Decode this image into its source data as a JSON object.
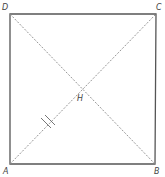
{
  "diagram": {
    "colors": {
      "side": "#555555",
      "diagonal": "#8a8a8a",
      "label": "#444444",
      "tick": "#666666"
    },
    "points": {
      "A": {
        "label": "A",
        "x": 10,
        "y": 164
      },
      "B": {
        "label": "B",
        "x": 155,
        "y": 164
      },
      "C": {
        "label": "C",
        "x": 156,
        "y": 14
      },
      "D": {
        "label": "D",
        "x": 10,
        "y": 14
      },
      "H": {
        "label": "H",
        "x": 82,
        "y": 89
      }
    },
    "sides": [
      "AB",
      "BC",
      "CD",
      "DA"
    ],
    "diagonals": [
      "AC",
      "BD"
    ],
    "tick_marks": {
      "segment": "AH",
      "count": 2
    }
  }
}
